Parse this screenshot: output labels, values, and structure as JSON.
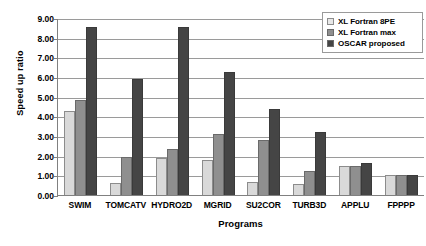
{
  "chart_data": {
    "type": "bar",
    "title": "",
    "xlabel": "Programs",
    "ylabel": "Speed up ratio",
    "ylim": [
      0.0,
      9.0
    ],
    "ytick_step": 1.0,
    "ytick_labels": [
      "9.00",
      "8.00",
      "7.00",
      "6.00",
      "5.00",
      "4.00",
      "3.00",
      "2.00",
      "1.00",
      "0.00"
    ],
    "ytick_values": [
      9.0,
      8.0,
      7.0,
      6.0,
      5.0,
      4.0,
      3.0,
      2.0,
      1.0,
      0.0
    ],
    "grid": true,
    "legend_position": "top-right",
    "categories": [
      "SWIM",
      "TOMCATV",
      "HYDRO2D",
      "MGRID",
      "SU2COR",
      "TURB3D",
      "APPLU",
      "FPPPP"
    ],
    "series": [
      {
        "name": "XL Fortran 8PE",
        "color": "#d9d9d9",
        "values": [
          4.25,
          0.6,
          1.9,
          1.8,
          0.65,
          0.55,
          1.5,
          1.0
        ]
      },
      {
        "name": "XL Fortran max",
        "color": "#8f8f8f",
        "values": [
          4.85,
          1.95,
          2.35,
          3.1,
          2.8,
          1.2,
          1.5,
          1.0
        ]
      },
      {
        "name": "OSCAR proposed",
        "color": "#454545",
        "values": [
          8.55,
          5.9,
          8.55,
          6.25,
          4.35,
          3.2,
          1.65,
          1.0
        ]
      }
    ]
  },
  "legend": {
    "items": [
      {
        "label": "XL Fortran 8PE"
      },
      {
        "label": "XL Fortran max"
      },
      {
        "label": "OSCAR proposed"
      }
    ]
  }
}
